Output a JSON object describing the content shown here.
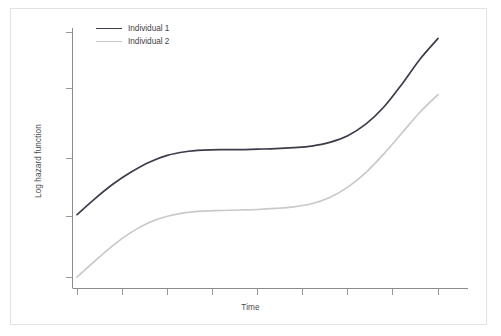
{
  "figure": {
    "background": "#ffffff",
    "border_color": "#e2e2e2"
  },
  "legend": {
    "position": "top-left-inside",
    "entries": [
      {
        "label": "Individual 1",
        "color": "#3c3c4b"
      },
      {
        "label": "Individual 2",
        "color": "#c9c9c9"
      }
    ]
  },
  "axes": {
    "xlabel": "Time",
    "ylabel": "Log hazard function",
    "tick_color": "#9a9a9a",
    "spine_color": "#8c8c8c"
  },
  "chart_data": {
    "type": "line",
    "title": "",
    "xlabel": "Time",
    "ylabel": "Log hazard function",
    "xlim": [
      0,
      8
    ],
    "ylim": [
      0,
      5
    ],
    "grid": false,
    "legend_position": "upper left",
    "x_tick_labels": [],
    "y_tick_labels": [],
    "x_ticks": [
      0,
      1,
      2,
      3,
      4,
      5,
      6,
      7,
      8
    ],
    "y_ticks": [
      0,
      1,
      2,
      3,
      4
    ],
    "note": "Two log hazard functions: both rise, plateau in the middle, then rise steeply at the end. Individual 1 is uniformly higher than Individual 2.",
    "series": [
      {
        "name": "Individual 1",
        "color": "#3c3c4b",
        "x": [
          0.0,
          0.4,
          0.8,
          1.2,
          1.6,
          2.0,
          2.4,
          2.8,
          3.2,
          3.6,
          4.0,
          4.4,
          4.8,
          5.2,
          5.6,
          6.0,
          6.4,
          6.8,
          7.2,
          7.6,
          8.0
        ],
        "y": [
          1.41,
          1.72,
          2.0,
          2.23,
          2.42,
          2.55,
          2.62,
          2.65,
          2.66,
          2.66,
          2.67,
          2.68,
          2.7,
          2.73,
          2.8,
          2.93,
          3.15,
          3.48,
          3.92,
          4.4,
          4.8
        ]
      },
      {
        "name": "Individual 2",
        "color": "#c9c9c9",
        "x": [
          0.0,
          0.4,
          0.8,
          1.2,
          1.6,
          2.0,
          2.4,
          2.8,
          3.2,
          3.6,
          4.0,
          4.4,
          4.8,
          5.2,
          5.6,
          6.0,
          6.4,
          6.8,
          7.2,
          7.6,
          8.0
        ],
        "y": [
          0.21,
          0.52,
          0.82,
          1.07,
          1.26,
          1.38,
          1.45,
          1.48,
          1.49,
          1.5,
          1.51,
          1.53,
          1.56,
          1.62,
          1.74,
          1.94,
          2.22,
          2.58,
          2.98,
          3.38,
          3.72
        ]
      }
    ]
  }
}
